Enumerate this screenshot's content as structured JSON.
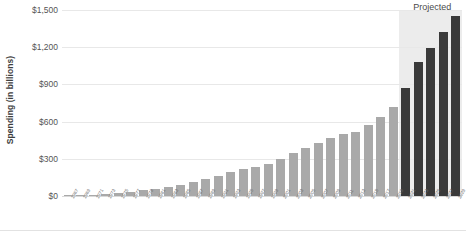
{
  "chart_data": {
    "type": "bar",
    "title": "",
    "xlabel": "",
    "ylabel": "Spending (in billions)",
    "ylim": [
      0,
      1500
    ],
    "yticks": [
      0,
      300,
      600,
      900,
      1200,
      1500
    ],
    "ytick_labels": [
      "$0",
      "$300",
      "$600",
      "$900",
      "$1,200",
      "$1,500"
    ],
    "grid": true,
    "legend": "none",
    "annotations": [
      {
        "text": "Projected",
        "starts_at_category": "2021"
      }
    ],
    "series": [
      {
        "name": "Spending (in billions)",
        "categories": [
          "1967",
          "1969",
          "1971",
          "1973",
          "1975",
          "1977",
          "1979",
          "1981",
          "1983",
          "1985",
          "1987",
          "1989",
          "1991",
          "1993",
          "1995",
          "1997",
          "1999",
          "2001",
          "2003",
          "2005",
          "2007",
          "2009",
          "2011",
          "2013",
          "2015",
          "2017",
          "2019",
          "2021",
          "2023",
          "2025",
          "2027",
          "2029"
        ],
        "values": [
          5,
          8,
          12,
          18,
          26,
          35,
          46,
          58,
          72,
          90,
          110,
          135,
          160,
          190,
          215,
          235,
          262,
          295,
          345,
          390,
          425,
          470,
          500,
          520,
          575,
          640,
          720,
          870,
          1080,
          1190,
          1320,
          1455
        ],
        "projected_from": "2021"
      }
    ]
  },
  "colors": {
    "historical_bar": "#a9a9a9",
    "projected_bar": "#3a3a3a",
    "projected_band": "#ececec",
    "gridline": "#e8e8e8",
    "axis_text": "#555555",
    "axis_title": "#3d3d3d"
  }
}
